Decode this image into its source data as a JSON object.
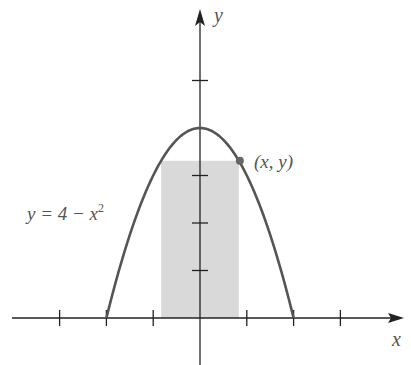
{
  "chart_data": {
    "type": "line",
    "title": "",
    "xlabel": "x",
    "ylabel": "y",
    "function": "y = 4 - x^2",
    "curve_label": "y = 4 − x",
    "curve_label_exp": "2",
    "point_label": "(x, y)",
    "x_ticks": [
      -3,
      -2,
      -1,
      1,
      2,
      3
    ],
    "y_ticks": [
      1,
      2,
      3,
      5
    ],
    "xlim": [
      -4.1,
      4.3
    ],
    "ylim": [
      -1,
      6.5
    ],
    "curve_domain": [
      -2,
      2
    ],
    "marked_point": {
      "x": 0.83,
      "y": 3.31
    },
    "shaded_rectangle": {
      "x0": -0.83,
      "x1": 0.83,
      "y0": 0,
      "y1": 3.31
    },
    "grid": false,
    "colors": {
      "curve": "#555555",
      "axes": "#222222",
      "fill": "#d9d9d9",
      "point": "#666666",
      "text": "#555555"
    }
  }
}
